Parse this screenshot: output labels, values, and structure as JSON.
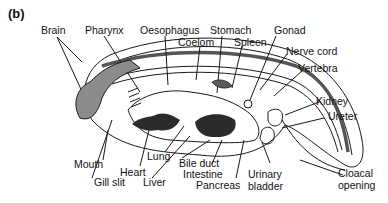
{
  "figure": {
    "panel_label": "(b)",
    "labels": {
      "brain": "Brain",
      "pharynx": "Pharynx",
      "oesophagus": "Oesophagus",
      "coelom": "Coelom",
      "stomach": "Stomach",
      "spleen": "Spleen",
      "gonad": "Gonad",
      "nerve_cord": "Nerve cord",
      "vertebra": "Vertebra",
      "kidney": "Kidney",
      "ureter": "Ureter",
      "mouth": "Mouth",
      "gill_slit": "Gill slit",
      "heart": "Heart",
      "lung": "Lung",
      "liver": "Liver",
      "bile_duct": "Bile duct",
      "intestine": "Intestine",
      "pancreas": "Pancreas",
      "urinary_bladder_1": "Urinary",
      "urinary_bladder_2": "bladder",
      "cloacal_opening_1": "Cloacal",
      "cloacal_opening_2": "opening"
    },
    "colors": {
      "line": "#1a1a1a",
      "organ_fill_gray": "#8c8c8c",
      "organ_fill_dark": "#2b2b2b",
      "background": "#ffffff"
    }
  }
}
